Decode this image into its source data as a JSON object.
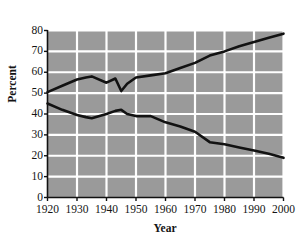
{
  "chart_data": {
    "type": "line",
    "title": "",
    "xlabel": "Year",
    "ylabel": "Percent",
    "xlim": [
      1920,
      2000
    ],
    "ylim": [
      0,
      80
    ],
    "xticks": [
      "1920",
      "1930",
      "1940",
      "1950",
      "1960",
      "1970",
      "1980",
      "1990",
      "2000"
    ],
    "yticks": [
      "0",
      "10",
      "20",
      "30",
      "40",
      "50",
      "60",
      "70",
      "80"
    ],
    "grid": true,
    "legend_position": "inline-annotations",
    "plot_background_color": "#9a9a9a",
    "gridline_color": "#ffffff",
    "line_color": "#121212",
    "axis_color": "#111111",
    "series": [
      {
        "name": "Service-producing",
        "label": "Service-producing",
        "x": [
          1920,
          1925,
          1930,
          1933,
          1935,
          1940,
          1943,
          1945,
          1947,
          1950,
          1955,
          1960,
          1965,
          1970,
          1975,
          1980,
          1985,
          1990,
          1995,
          2000
        ],
        "values": [
          50.5,
          53.5,
          56.5,
          57.5,
          58.0,
          55.0,
          57.0,
          51.0,
          54.5,
          57.5,
          58.5,
          59.5,
          62.0,
          64.5,
          68.0,
          70.0,
          72.5,
          74.5,
          76.5,
          78.5
        ]
      },
      {
        "name": "Goods-producing",
        "label": "Goods-producing",
        "x": [
          1920,
          1925,
          1930,
          1933,
          1935,
          1940,
          1943,
          1945,
          1947,
          1950,
          1955,
          1960,
          1965,
          1970,
          1975,
          1980,
          1985,
          1990,
          1995,
          2000
        ],
        "values": [
          45.0,
          42.0,
          39.5,
          38.5,
          38.0,
          40.0,
          41.5,
          42.0,
          40.0,
          39.0,
          39.0,
          36.0,
          34.0,
          31.5,
          26.5,
          25.5,
          24.0,
          22.5,
          21.0,
          19.0
        ]
      }
    ],
    "annotations": [
      {
        "text": "Service-producing",
        "x": 1948,
        "y": 73.5
      },
      {
        "text": "Goods-producing",
        "x": 1943,
        "y": 23.5
      }
    ]
  }
}
